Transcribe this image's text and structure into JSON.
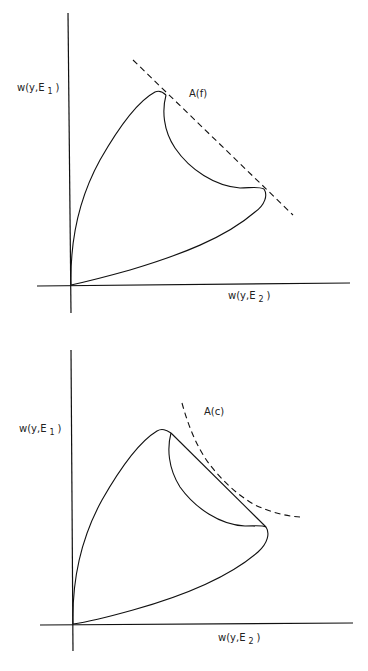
{
  "figures": [
    {
      "id": "top",
      "y_label": {
        "main": "w(y,E",
        "sub": "1",
        "close": ")"
      },
      "x_label": {
        "main": "w(y,E",
        "sub": "2",
        "close": ")"
      },
      "support_label": "A(f)",
      "support_type": "linear (dashed straight line)"
    },
    {
      "id": "bottom",
      "y_label": {
        "main": "w(y,E",
        "sub": "1",
        "close": ")"
      },
      "x_label": {
        "main": "w(y,E",
        "sub": "2",
        "close": ")"
      },
      "support_label": "A(c)",
      "support_type": "convex (dashed curve)"
    }
  ],
  "colors": {
    "ink": "#111111",
    "background": "#ffffff"
  }
}
